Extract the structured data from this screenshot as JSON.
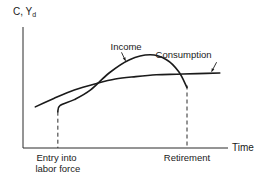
{
  "chart_data": {
    "type": "line",
    "title": "",
    "ylabel": "C, Y",
    "ylabel_subscript": "d",
    "xlabel": "Time",
    "xlim": [
      0,
      10
    ],
    "ylim": [
      0,
      10
    ],
    "grid": false,
    "legend": "none",
    "x_annotations": [
      {
        "label_lines": [
          "Entry into",
          "labor force"
        ],
        "x": 1.7
      },
      {
        "label_lines": [
          "Retirement"
        ],
        "x": 8.0
      }
    ],
    "series": [
      {
        "name": "Income",
        "points": [
          [
            1.7,
            3.0
          ],
          [
            1.8,
            3.5
          ],
          [
            2.5,
            4.0
          ],
          [
            3.3,
            4.8
          ],
          [
            4.2,
            6.2
          ],
          [
            5.2,
            7.3
          ],
          [
            6.2,
            7.7
          ],
          [
            7.0,
            7.3
          ],
          [
            7.6,
            6.3
          ],
          [
            8.0,
            5.0
          ]
        ]
      },
      {
        "name": "Consumption",
        "points": [
          [
            0.6,
            3.4
          ],
          [
            1.5,
            4.1
          ],
          [
            2.5,
            4.8
          ],
          [
            3.5,
            5.3
          ],
          [
            4.5,
            5.7
          ],
          [
            5.5,
            5.9
          ],
          [
            6.5,
            6.05
          ],
          [
            7.5,
            6.1
          ],
          [
            8.5,
            6.15
          ],
          [
            9.6,
            6.2
          ]
        ]
      }
    ],
    "annotations": [
      {
        "text": "Income",
        "points_to": "Income",
        "at_x": 5.0
      },
      {
        "text": "Consumption",
        "points_to": "Consumption",
        "at_x": 9.2
      }
    ]
  }
}
